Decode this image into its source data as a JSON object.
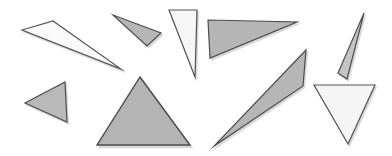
{
  "canvas": {
    "width": 392,
    "height": 156,
    "background_color": "#ffffff",
    "title": "triangles-shape-collection"
  },
  "palette": {
    "fill_gray": "#b5b5b5",
    "fill_light_gray": "#d0d0d0",
    "fill_white": "#f4f4f4",
    "fill_near_white": "#fafafa",
    "stroke_dark": "#4a4a4a",
    "stroke_mid": "#6e6e6e",
    "shadow": "#b9b9b9"
  },
  "shapes": [
    {
      "id": "triangle-1",
      "name": "thin-sliver-top-left",
      "label": "Thin elongated triangle pointing right-down",
      "points": "22,30 53,21 121,69",
      "fill": "#fafafa",
      "stroke": "#555555",
      "stroke_width": 1.2,
      "shadow_dx": 1.5,
      "shadow_dy": 2
    },
    {
      "id": "triangle-2",
      "name": "small-gray-arrow-top",
      "label": "Small gray triangle pointing left",
      "points": "113,15 161,33 147,46",
      "fill": "#b7b7b7",
      "stroke": "#4f4f4f",
      "stroke_width": 1.2,
      "shadow_dx": 1.5,
      "shadow_dy": 2
    },
    {
      "id": "triangle-3",
      "name": "narrow-white-triangle-top",
      "label": "Narrow white triangle pointing down",
      "points": "169,10 197,10 195,77",
      "fill": "#f6f6f6",
      "stroke": "#525252",
      "stroke_width": 1.2,
      "shadow_dx": 1.5,
      "shadow_dy": 2
    },
    {
      "id": "triangle-4",
      "name": "gray-right-triangle-top",
      "label": "Wide gray right triangle",
      "points": "208,20 297,22 210,58",
      "fill": "#b5b5b5",
      "stroke": "#4d4d4d",
      "stroke_width": 1.2,
      "shadow_dx": 1.5,
      "shadow_dy": 2
    },
    {
      "id": "triangle-5",
      "name": "thin-sliver-right",
      "label": "Thin vertical sliver triangle at right",
      "points": "364,13 338,73 347,79",
      "fill": "#c4c4c4",
      "stroke": "#4f4f4f",
      "stroke_width": 1.2,
      "shadow_dx": 1.5,
      "shadow_dy": 2
    },
    {
      "id": "triangle-6",
      "name": "white-downward-triangle-right",
      "label": "White triangle pointing down at lower right",
      "points": "314,85 375,85 348,144",
      "fill": "#f5f5f5",
      "stroke": "#525252",
      "stroke_width": 1.2,
      "shadow_dx": 1.5,
      "shadow_dy": 2
    },
    {
      "id": "triangle-7",
      "name": "gray-left-pointing-triangle",
      "label": "Small gray triangle pointing left at lower left",
      "points": "65,82 67,122 25,103",
      "fill": "#b9b9b9",
      "stroke": "#4d4d4d",
      "stroke_width": 1.2,
      "shadow_dx": 1.5,
      "shadow_dy": 2
    },
    {
      "id": "triangle-8",
      "name": "large-gray-equilateral-triangle",
      "label": "Large gray equilateral triangle at center",
      "points": "140,77 190,145 97,145",
      "fill": "#b4b4b4",
      "stroke": "#4a4a4a",
      "stroke_width": 1.4,
      "shadow_dx": 2,
      "shadow_dy": 2.5
    },
    {
      "id": "triangle-9",
      "name": "long-diagonal-sliver",
      "label": "Long diagonal gray sliver triangle",
      "points": "306,50 303,86 214,146",
      "fill": "#b6b6b6",
      "stroke": "#4d4d4d",
      "stroke_width": 1.2,
      "shadow_dx": 1.5,
      "shadow_dy": 2
    }
  ]
}
